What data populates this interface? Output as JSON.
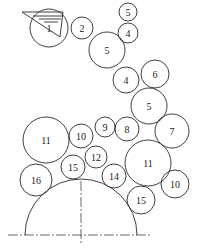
{
  "diagram": {
    "type": "circle-packing-chain",
    "circles": [
      {
        "label": "1",
        "cx": 49,
        "cy": 28,
        "r": 19
      },
      {
        "label": "2",
        "cx": 82,
        "cy": 28,
        "r": 11
      },
      {
        "label": "5",
        "cx": 128,
        "cy": 12,
        "r": 9
      },
      {
        "label": "4",
        "cx": 128,
        "cy": 33,
        "r": 10
      },
      {
        "label": "5",
        "cx": 107,
        "cy": 50,
        "r": 18
      },
      {
        "label": "4",
        "cx": 126,
        "cy": 80,
        "r": 13
      },
      {
        "label": "6",
        "cx": 155,
        "cy": 74,
        "r": 14
      },
      {
        "label": "5",
        "cx": 149,
        "cy": 106,
        "r": 18
      },
      {
        "label": "7",
        "cx": 172,
        "cy": 131,
        "r": 17
      },
      {
        "label": "8",
        "cx": 127,
        "cy": 129,
        "r": 12
      },
      {
        "label": "9",
        "cx": 105,
        "cy": 127,
        "r": 10
      },
      {
        "label": "10",
        "cx": 81,
        "cy": 136,
        "r": 12
      },
      {
        "label": "11",
        "cx": 46,
        "cy": 140,
        "r": 23
      },
      {
        "label": "12",
        "cx": 96,
        "cy": 157,
        "r": 11
      },
      {
        "label": "11",
        "cx": 148,
        "cy": 163,
        "r": 23
      },
      {
        "label": "10",
        "cx": 175,
        "cy": 184,
        "r": 14
      },
      {
        "label": "14",
        "cx": 114,
        "cy": 176,
        "r": 12
      },
      {
        "label": "15",
        "cx": 73,
        "cy": 167,
        "r": 12
      },
      {
        "label": "16",
        "cx": 36,
        "cy": 180,
        "r": 16
      },
      {
        "label": "15",
        "cx": 141,
        "cy": 200,
        "r": 14
      }
    ],
    "base_arc": {
      "cx": 81,
      "cy": 235,
      "r": 56
    },
    "wedge_symbol": "water-level-hatch"
  }
}
